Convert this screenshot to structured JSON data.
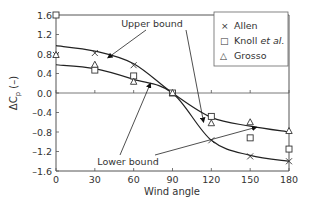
{
  "chart_data": {
    "type": "scatter",
    "title": "",
    "xlabel": "Wind angle",
    "ylabel": "ΔCp (–)",
    "xlim": [
      0,
      180
    ],
    "ylim": [
      -1.6,
      1.6
    ],
    "xticks": [
      0,
      30,
      60,
      90,
      120,
      150,
      180
    ],
    "yticks": [
      1.6,
      1.2,
      0.8,
      0.4,
      0.0,
      -0.4,
      -0.8,
      -1.2,
      -1.6
    ],
    "ytick_labels": [
      "1.6",
      "1.2",
      "0.8",
      "0.4",
      "0.0",
      "–0.4",
      "–0.8",
      "–1.2",
      "–1.6"
    ],
    "grid": false,
    "legend_position": "upper right",
    "series": [
      {
        "name": "Allen",
        "marker": "x",
        "x": [
          0,
          30,
          60,
          90,
          120,
          150,
          180
        ],
        "values": [
          0.78,
          0.82,
          0.57,
          0.0,
          -0.97,
          -1.3,
          -1.4
        ]
      },
      {
        "name": "Knoll et al.",
        "marker": "square",
        "x": [
          0,
          30,
          60,
          90,
          120,
          150,
          180
        ],
        "values": [
          1.6,
          0.47,
          0.35,
          0.0,
          -0.48,
          -0.92,
          -1.15
        ]
      },
      {
        "name": "Grosso",
        "marker": "triangle",
        "x": [
          0,
          30,
          60,
          90,
          120,
          150,
          180
        ],
        "values": [
          0.78,
          0.58,
          0.23,
          0.0,
          -0.62,
          -0.6,
          -0.78
        ]
      }
    ],
    "curves": [
      {
        "name": "Upper bound",
        "x": [
          0,
          30,
          60,
          90,
          120,
          150,
          180
        ],
        "values": [
          0.97,
          0.86,
          0.6,
          0.0,
          -0.5,
          -0.68,
          -0.8
        ]
      },
      {
        "name": "Lower bound",
        "x": [
          0,
          30,
          60,
          90,
          120,
          150,
          180
        ],
        "values": [
          0.58,
          0.5,
          0.28,
          0.0,
          -0.97,
          -1.28,
          -1.4
        ]
      }
    ],
    "annotations": [
      {
        "text": "Upper bound",
        "arrows_to": [
          [
            40,
            0.72
          ],
          [
            114,
            -0.6
          ]
        ]
      },
      {
        "text": "Lower bound",
        "arrows_to": [
          [
            73,
            0.2
          ],
          [
            155,
            -0.7
          ]
        ]
      }
    ]
  },
  "legend": {
    "items": [
      {
        "symbol": "×",
        "label": "Allen"
      },
      {
        "symbol": "□",
        "label": "Knoll",
        "label_italic": "et al."
      },
      {
        "symbol": "△",
        "label": "Grosso"
      }
    ]
  },
  "labels": {
    "upper_bound": "Upper bound",
    "lower_bound": "Lower bound",
    "xlabel": "Wind angle",
    "ylabel_main": "ΔC",
    "ylabel_sub": "p",
    "ylabel_unit": " (–)"
  }
}
